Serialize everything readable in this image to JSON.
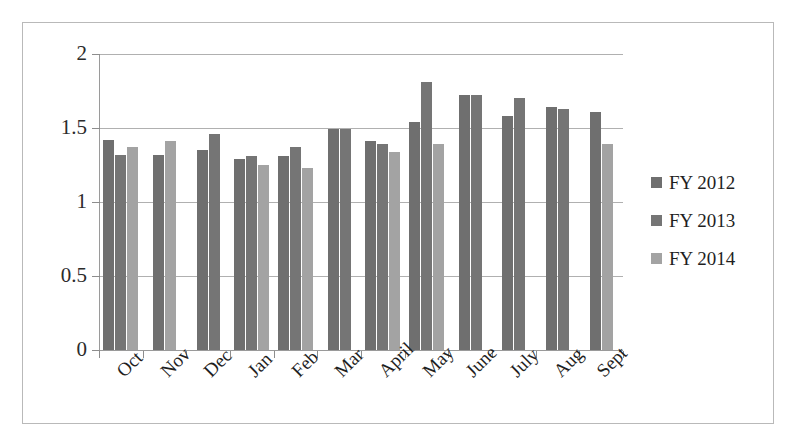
{
  "chart_data": {
    "type": "bar",
    "title": "",
    "xlabel": "",
    "ylabel": "",
    "ylim": [
      0,
      2
    ],
    "yticks": [
      "0",
      "0.5",
      "1",
      "1.5",
      "2"
    ],
    "ytick_values": [
      0,
      0.5,
      1,
      1.5,
      2
    ],
    "grid": true,
    "legend_position": "right",
    "categories": [
      "Oct",
      "Nov",
      "Dec",
      "Jan",
      "Feb",
      "Mar",
      "April",
      "May",
      "June",
      "July",
      "Aug",
      "Sept"
    ],
    "series": [
      {
        "name": "FY 2012",
        "color": "#6f6f6f",
        "values": [
          1.42,
          1.32,
          1.35,
          1.29,
          1.31,
          1.49,
          1.41,
          1.54,
          1.72,
          1.58,
          1.64,
          1.61
        ]
      },
      {
        "name": "FY 2013",
        "color": "#757575",
        "values": [
          1.32,
          null,
          1.46,
          1.31,
          1.37,
          1.49,
          1.39,
          1.81,
          1.72,
          1.7,
          1.63,
          null
        ]
      },
      {
        "name": "FY 2014",
        "color": "#a3a3a3",
        "values": [
          1.37,
          1.41,
          null,
          1.25,
          1.23,
          null,
          1.34,
          1.39,
          null,
          null,
          null,
          1.39
        ]
      }
    ]
  },
  "legend": {
    "items": [
      {
        "label": "FY 2012",
        "swatch": "legend-swatch-fy2012"
      },
      {
        "label": "FY 2013",
        "swatch": "legend-swatch-fy2013"
      },
      {
        "label": "FY 2014",
        "swatch": "legend-swatch-fy2014"
      }
    ]
  }
}
